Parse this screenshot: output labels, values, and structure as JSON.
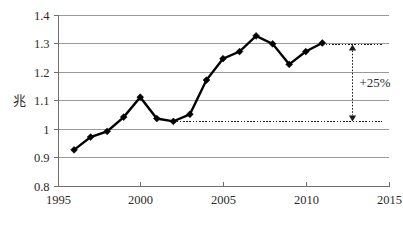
{
  "chart_data": {
    "type": "line",
    "title": "",
    "subtitle": "",
    "xlabel": "",
    "ylabel": "兆",
    "xlim": [
      1995,
      2015
    ],
    "ylim": [
      0.8,
      1.4
    ],
    "grid": true,
    "legend": false,
    "legend_position": "none",
    "x_ticks": [
      1995,
      2000,
      2005,
      2010,
      2015
    ],
    "x_tick_labels": [
      "1995",
      "2000",
      "2005",
      "2010",
      "2015"
    ],
    "y_ticks": [
      0.8,
      0.9,
      1.0,
      1.1,
      1.2,
      1.3,
      1.4
    ],
    "y_tick_labels": [
      "0.8",
      "0.9",
      "1",
      "1.1",
      "1.2",
      "1.3",
      "1.4"
    ],
    "x": [
      1996,
      1997,
      1998,
      1999,
      2000,
      2001,
      2002,
      2003,
      2004,
      2005,
      2006,
      2007,
      2008,
      2009,
      2010,
      2011
    ],
    "values": [
      0.925,
      0.97,
      0.99,
      1.04,
      1.11,
      1.035,
      1.025,
      1.05,
      1.17,
      1.245,
      1.27,
      1.325,
      1.297,
      1.225,
      1.27,
      1.3
    ],
    "series": [
      {
        "name": "",
        "marker": "diamond",
        "color": "#000000",
        "values": [
          0.925,
          0.97,
          0.99,
          1.04,
          1.11,
          1.035,
          1.025,
          1.05,
          1.17,
          1.245,
          1.27,
          1.325,
          1.297,
          1.225,
          1.27,
          1.3
        ]
      }
    ],
    "annotations": [
      {
        "name": "growth-callout",
        "label": "+25%",
        "type": "double-arrow",
        "from_value": 1.025,
        "to_value": 1.295,
        "at_x": 2012.8
      },
      {
        "name": "upper-reference-line",
        "type": "dashed-hline",
        "value": 1.295,
        "x_start": 2011,
        "x_end": 2014.6
      },
      {
        "name": "lower-reference-line",
        "type": "dashed-hline",
        "value": 1.025,
        "x_start": 2002,
        "x_end": 2014.6
      }
    ]
  },
  "colors": {
    "series": "#000000",
    "gridline": "#9a9a9a",
    "axis": "#6e6e6e",
    "text": "#2b2b2b",
    "background": "#ffffff"
  }
}
